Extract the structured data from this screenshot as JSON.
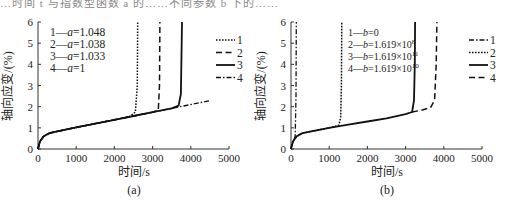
{
  "header_fragment": "…时间 t 与指数型函数 a 的……不同参数 b 下的……",
  "chart_data": [
    {
      "panel": "(a)",
      "type": "line",
      "title": "",
      "xlabel": "时间/s",
      "ylabel": "轴向应变/(%)",
      "xlim": [
        0,
        5000
      ],
      "ylim": [
        0,
        6
      ],
      "xticks": [
        0,
        1000,
        2000,
        3000,
        4000,
        5000
      ],
      "yticks": [
        0,
        1,
        2,
        3,
        4,
        5,
        6
      ],
      "grid": false,
      "legend_position": "right",
      "annotation_lines": [
        "1—a=1.048",
        "2—a=1.038",
        "3—a=1.033",
        "4—a=1"
      ],
      "series": [
        {
          "name": "1",
          "param": "a=1.048",
          "style": "dotted",
          "x": [
            0,
            50,
            150,
            300,
            500,
            1000,
            1500,
            2000,
            2400,
            2550,
            2600,
            2610
          ],
          "y": [
            0,
            0.35,
            0.6,
            0.75,
            0.83,
            1.02,
            1.2,
            1.38,
            1.53,
            1.75,
            3.0,
            6.0
          ]
        },
        {
          "name": "2",
          "param": "a=1.038",
          "style": "dashed",
          "x": [
            0,
            50,
            150,
            300,
            500,
            1000,
            1500,
            2000,
            2500,
            3000,
            3150,
            3180,
            3190
          ],
          "y": [
            0,
            0.35,
            0.6,
            0.75,
            0.83,
            1.02,
            1.2,
            1.38,
            1.56,
            1.74,
            1.85,
            3.0,
            6.0
          ]
        },
        {
          "name": "3",
          "param": "a=1.033",
          "style": "solid",
          "x": [
            0,
            50,
            150,
            300,
            500,
            1000,
            1500,
            2000,
            2500,
            3000,
            3500,
            3680,
            3740,
            3770
          ],
          "y": [
            0,
            0.35,
            0.6,
            0.75,
            0.83,
            1.02,
            1.2,
            1.38,
            1.56,
            1.74,
            1.92,
            2.05,
            2.6,
            6.0
          ]
        },
        {
          "name": "4",
          "param": "a=1",
          "style": "dash-dot",
          "x": [
            0,
            50,
            150,
            300,
            500,
            1000,
            1500,
            2000,
            2500,
            3000,
            3500,
            4000,
            4500
          ],
          "y": [
            0,
            0.35,
            0.6,
            0.75,
            0.83,
            1.02,
            1.2,
            1.38,
            1.56,
            1.74,
            1.92,
            2.1,
            2.28
          ]
        }
      ]
    },
    {
      "panel": "(b)",
      "type": "line",
      "title": "",
      "xlabel": "时间/s",
      "ylabel": "轴向应变/(%)",
      "xlim": [
        0,
        5000
      ],
      "ylim": [
        0,
        6
      ],
      "xticks": [
        0,
        1000,
        2000,
        3000,
        4000,
        5000
      ],
      "yticks": [
        0,
        1,
        2,
        3,
        4,
        5,
        6
      ],
      "grid": false,
      "legend_position": "right",
      "annotation_lines": [
        "1—b=0",
        "2—b=1.619×10^8",
        "3—b=1.619×10^11",
        "4—b=1.619×10^10"
      ],
      "series": [
        {
          "name": "1",
          "param": "b=0",
          "style": "dash-dot",
          "x": [
            0,
            30,
            80,
            110,
            130,
            140
          ],
          "y": [
            0,
            0.25,
            0.45,
            0.6,
            2.5,
            6.0
          ]
        },
        {
          "name": "2",
          "param": "b=1.619×10^8",
          "style": "dotted",
          "x": [
            0,
            50,
            150,
            300,
            500,
            1000,
            1250,
            1300,
            1320,
            1330
          ],
          "y": [
            0,
            0.35,
            0.6,
            0.75,
            0.82,
            1.0,
            1.12,
            1.5,
            3.0,
            6.0
          ]
        },
        {
          "name": "3",
          "param": "b=1.619×10^11",
          "style": "solid",
          "x": [
            0,
            50,
            150,
            300,
            500,
            1000,
            1500,
            2000,
            2500,
            3000,
            3170,
            3220,
            3240,
            3250
          ],
          "y": [
            0,
            0.35,
            0.6,
            0.75,
            0.82,
            1.0,
            1.15,
            1.3,
            1.45,
            1.65,
            1.75,
            2.3,
            4.0,
            6.0
          ]
        },
        {
          "name": "4",
          "param": "b=1.619×10^10",
          "style": "dashed",
          "x": [
            3170,
            3400,
            3650,
            3760,
            3800,
            3820
          ],
          "y": [
            1.75,
            1.83,
            1.95,
            2.3,
            4.0,
            6.0
          ]
        }
      ]
    }
  ],
  "panels": {
    "a": {
      "label": "(a)",
      "ylabel": "轴向应变/(%)",
      "xlabel": "时间/s",
      "xticks": [
        "0",
        "1000",
        "2000",
        "3000",
        "4000",
        "5000"
      ],
      "yticks": [
        "0",
        "1",
        "2",
        "3",
        "4",
        "5",
        "6"
      ],
      "annotation": [
        {
          "num": "1",
          "var": "a",
          "val": "=1.048"
        },
        {
          "num": "2",
          "var": "a",
          "val": "=1.038"
        },
        {
          "num": "3",
          "var": "a",
          "val": "=1.033"
        },
        {
          "num": "4",
          "var": "a",
          "val": "=1"
        }
      ],
      "legend": [
        "1",
        "2",
        "3",
        "4"
      ]
    },
    "b": {
      "label": "(b)",
      "ylabel": "轴向应变/(%)",
      "xlabel": "时间/s",
      "xticks": [
        "0",
        "1000",
        "2000",
        "3000",
        "4000",
        "5000"
      ],
      "yticks": [
        "0",
        "1",
        "2",
        "3",
        "4",
        "5",
        "6"
      ],
      "annotation": [
        {
          "num": "1",
          "var": "b",
          "val": "=0",
          "exp": ""
        },
        {
          "num": "2",
          "var": "b",
          "val": "=1.619×10",
          "exp": "8"
        },
        {
          "num": "3",
          "var": "b",
          "val": "=1.619×10",
          "exp": "11"
        },
        {
          "num": "4",
          "var": "b",
          "val": "=1.619×10",
          "exp": "10"
        }
      ],
      "legend": [
        "1",
        "2",
        "3",
        "4"
      ]
    }
  },
  "colors": {
    "line": "#111111",
    "axis": "#333333",
    "text": "#222222",
    "background": "#ffffff"
  }
}
